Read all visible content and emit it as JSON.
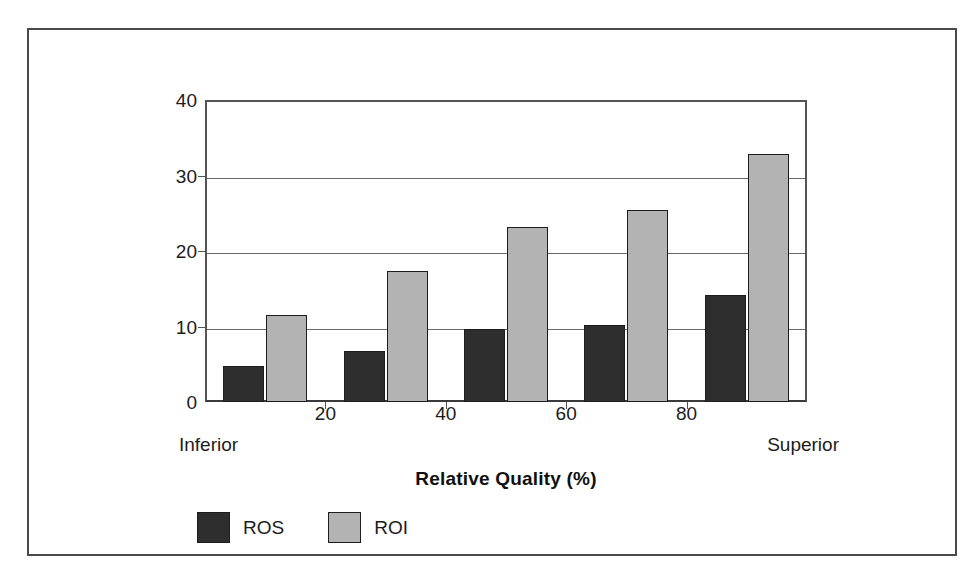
{
  "figure": {
    "frame_border_color": "#4a4a4a",
    "background_color": "#ffffff"
  },
  "legend": {
    "position": "below-axis-left",
    "entries": [
      {
        "label": "ROS",
        "color": "#2e2e2e"
      },
      {
        "label": "ROI",
        "color": "#b3b3b3"
      }
    ]
  },
  "axis": {
    "x_endpoint_low": "Inferior",
    "x_endpoint_high": "Superior",
    "x_title": "Relative Quality (%)",
    "y_ticks": [
      "0",
      "10",
      "20",
      "30",
      "40"
    ],
    "x_ticks": [
      "20",
      "40",
      "60",
      "80"
    ]
  },
  "chart_data": {
    "type": "bar",
    "title": "",
    "xlabel": "Relative Quality (%)",
    "ylabel": "",
    "categories": [
      "10",
      "30",
      "50",
      "70",
      "90"
    ],
    "x": [
      10,
      30,
      50,
      70,
      90
    ],
    "series": [
      {
        "name": "ROS",
        "color": "#2e2e2e",
        "values": [
          4.8,
          6.8,
          9.7,
          10.2,
          14.2
        ]
      },
      {
        "name": "ROI",
        "color": "#b3b3b3",
        "values": [
          11.5,
          17.4,
          23.2,
          25.4,
          32.8
        ]
      }
    ],
    "ylim": [
      0,
      40
    ],
    "xlim": [
      0,
      100
    ],
    "yticks": [
      0,
      10,
      20,
      30,
      40
    ],
    "xticks": [
      20,
      40,
      60,
      80
    ],
    "xtick_labels": [
      "20",
      "40",
      "60",
      "80"
    ],
    "ytick_labels": [
      "0",
      "10",
      "20",
      "30",
      "40"
    ],
    "grid": "horizontal",
    "legend_position": "bottom-left",
    "annotations": [
      "Inferior",
      "Superior"
    ]
  }
}
